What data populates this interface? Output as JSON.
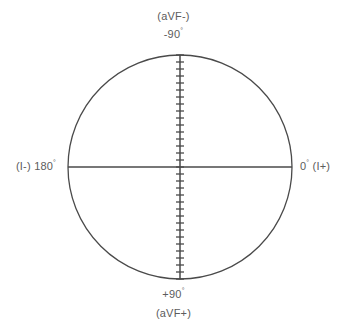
{
  "diagram": {
    "name": "hexaxial-reference-circle",
    "geometry": {
      "center_x": 180,
      "center_y": 167,
      "radius": 112,
      "stroke_color": "#4a4a4a",
      "stroke_width": 1.3,
      "background": "#ffffff"
    },
    "labels": {
      "top_lead": "(aVF-)",
      "top_degrees_value": "-90",
      "top_degrees_symbol": "°",
      "bottom_degrees_value": "+90",
      "bottom_degrees_symbol": "°",
      "bottom_lead": "(aVF+)",
      "left_full": "(I-) 180",
      "left_lead": "(I-)",
      "left_degrees_value": "180",
      "left_degrees_symbol": "°",
      "right_degrees_value": "0",
      "right_degrees_symbol": "°",
      "right_lead": "(I+)",
      "text_color": "#5c5c5c"
    },
    "axes": {
      "vertical": {
        "label": "vertical-axis",
        "has_ticks": true,
        "tick_count": 33,
        "tick_spacing_px": 7,
        "tick_half_width_px": 4
      },
      "horizontal": {
        "label": "horizontal-axis",
        "has_ticks": false
      }
    }
  },
  "chart_data": {
    "type": "scatter",
    "xlabel": "",
    "ylabel": "",
    "grid": false,
    "legend_position": "none",
    "axis_ranges": {
      "degrees_min": -180,
      "degrees_max": 180
    },
    "annotations": [
      {
        "position": "top",
        "degrees": -90,
        "lead": "aVF-",
        "text": "-90°"
      },
      {
        "position": "right",
        "degrees": 0,
        "lead": "I+",
        "text": "0°"
      },
      {
        "position": "bottom",
        "degrees": 90,
        "lead": "aVF+",
        "text": "+90°"
      },
      {
        "position": "left",
        "degrees": 180,
        "lead": "I-",
        "text": "180°"
      }
    ],
    "series": []
  }
}
